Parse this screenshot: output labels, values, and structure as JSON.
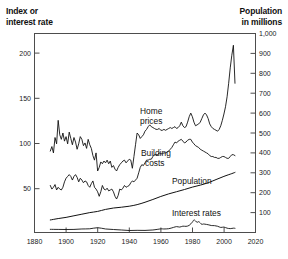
{
  "left_axis_title": "Index or\ninterest rate",
  "right_axis_title": "Population\nin millions",
  "labels": {
    "home_prices": "Home",
    "home_prices2": "prices",
    "building_costs": "Building",
    "building_costs2": "costs",
    "population": "Population",
    "interest_rates": "Interest rates"
  },
  "ticks": {
    "x": [
      "1880",
      "1900",
      "1920",
      "1940",
      "1960",
      "1980",
      "2000",
      "2020"
    ],
    "y_left": [
      "200",
      "150",
      "100",
      "50"
    ],
    "y_right": [
      "1,000",
      "900",
      "800",
      "700",
      "600",
      "500",
      "400",
      "300",
      "200",
      "100"
    ]
  },
  "colors": {
    "background": "#ffffff",
    "line": "#111111",
    "frame": "#4d4d4d",
    "text": "#111111"
  },
  "chart_data": {
    "type": "line",
    "title": "",
    "xlabel": "",
    "ylabel": "Index or interest rate",
    "ylabel_right": "Population in millions",
    "xlim": [
      1880,
      2020
    ],
    "ylim": [
      0,
      220
    ],
    "ylim_right": [
      0,
      1000
    ],
    "grid": false,
    "legend": "inline-annotations",
    "xticks": [
      1880,
      1900,
      1920,
      1940,
      1960,
      1980,
      2000,
      2020
    ],
    "yticks_left": [
      50,
      100,
      150,
      200
    ],
    "yticks_right": [
      100,
      200,
      300,
      400,
      500,
      600,
      700,
      800,
      900,
      1000
    ],
    "series": [
      {
        "name": "Home prices",
        "axis": "left",
        "x": [
          1890,
          1891,
          1892,
          1893,
          1894,
          1895,
          1896,
          1897,
          1898,
          1899,
          1900,
          1901,
          1902,
          1903,
          1904,
          1905,
          1906,
          1907,
          1908,
          1909,
          1910,
          1911,
          1912,
          1913,
          1914,
          1915,
          1916,
          1917,
          1918,
          1919,
          1920,
          1921,
          1922,
          1923,
          1924,
          1925,
          1926,
          1927,
          1928,
          1929,
          1930,
          1931,
          1932,
          1933,
          1934,
          1935,
          1936,
          1937,
          1938,
          1939,
          1940,
          1941,
          1942,
          1943,
          1944,
          1945,
          1946,
          1947,
          1948,
          1949,
          1950,
          1951,
          1952,
          1953,
          1954,
          1955,
          1956,
          1957,
          1958,
          1959,
          1960,
          1961,
          1962,
          1963,
          1964,
          1965,
          1966,
          1967,
          1968,
          1969,
          1970,
          1971,
          1972,
          1973,
          1974,
          1975,
          1976,
          1977,
          1978,
          1979,
          1980,
          1981,
          1982,
          1983,
          1984,
          1985,
          1986,
          1987,
          1988,
          1989,
          1990,
          1991,
          1992,
          1993,
          1994,
          1995,
          1996,
          1997,
          1998,
          1999,
          2000,
          2001,
          2002,
          2003,
          2004,
          2005,
          2006,
          2007
        ],
        "values": [
          90,
          95,
          88,
          105,
          98,
          124,
          108,
          103,
          110,
          101,
          106,
          98,
          111,
          104,
          97,
          105,
          100,
          92,
          98,
          106,
          103,
          96,
          99,
          93,
          103,
          97,
          93,
          85,
          80,
          88,
          68,
          72,
          78,
          76,
          79,
          77,
          80,
          76,
          79,
          72,
          74,
          70,
          68,
          72,
          75,
          77,
          79,
          80,
          77,
          79,
          81,
          80,
          71,
          84,
          97,
          110,
          108,
          104,
          106,
          108,
          112,
          114,
          117,
          119,
          117,
          116,
          115,
          114,
          114,
          115,
          113,
          113,
          114,
          113,
          114,
          115,
          116,
          115,
          116,
          117,
          115,
          116,
          118,
          122,
          118,
          116,
          117,
          122,
          128,
          132,
          128,
          122,
          118,
          119,
          120,
          122,
          126,
          130,
          132,
          130,
          126,
          120,
          117,
          115,
          114,
          113,
          112,
          114,
          118,
          124,
          131,
          139,
          150,
          165,
          182,
          196,
          207,
          165
        ]
      },
      {
        "name": "Building costs",
        "axis": "left",
        "x": [
          1890,
          1891,
          1892,
          1893,
          1894,
          1895,
          1896,
          1897,
          1898,
          1899,
          1900,
          1901,
          1902,
          1903,
          1904,
          1905,
          1906,
          1907,
          1908,
          1909,
          1910,
          1911,
          1912,
          1913,
          1914,
          1915,
          1916,
          1917,
          1918,
          1919,
          1920,
          1921,
          1922,
          1923,
          1924,
          1925,
          1926,
          1927,
          1928,
          1929,
          1930,
          1931,
          1932,
          1933,
          1934,
          1935,
          1936,
          1937,
          1938,
          1939,
          1940,
          1941,
          1942,
          1943,
          1944,
          1945,
          1946,
          1947,
          1948,
          1949,
          1950,
          1951,
          1952,
          1953,
          1954,
          1955,
          1956,
          1957,
          1958,
          1959,
          1960,
          1961,
          1962,
          1963,
          1964,
          1965,
          1966,
          1967,
          1968,
          1969,
          1970,
          1971,
          1972,
          1973,
          1974,
          1975,
          1976,
          1977,
          1978,
          1979,
          1980,
          1981,
          1982,
          1983,
          1984,
          1985,
          1986,
          1987,
          1988,
          1989,
          1990,
          1991,
          1992,
          1993,
          1994,
          1995,
          1996,
          1997,
          1998,
          1999,
          2000,
          2001,
          2002,
          2003,
          2004,
          2005,
          2006,
          2007
        ],
        "values": [
          52,
          48,
          50,
          53,
          47,
          50,
          48,
          47,
          50,
          56,
          60,
          62,
          64,
          62,
          58,
          62,
          64,
          61,
          56,
          60,
          58,
          55,
          57,
          56,
          52,
          50,
          54,
          57,
          50,
          48,
          45,
          40,
          45,
          52,
          48,
          47,
          49,
          46,
          47,
          48,
          45,
          40,
          37,
          41,
          48,
          47,
          49,
          52,
          50,
          51,
          52,
          55,
          57,
          56,
          58,
          60,
          66,
          72,
          75,
          74,
          77,
          80,
          80,
          81,
          81,
          84,
          86,
          86,
          86,
          88,
          87,
          87,
          88,
          88,
          89,
          90,
          92,
          94,
          97,
          100,
          99,
          101,
          102,
          103,
          101,
          99,
          100,
          102,
          103,
          103,
          100,
          98,
          96,
          95,
          94,
          92,
          91,
          90,
          89,
          88,
          87,
          85,
          84,
          84,
          83,
          83,
          82,
          82,
          83,
          84,
          84,
          83,
          82,
          82,
          84,
          86,
          86,
          85
        ]
      },
      {
        "name": "Population",
        "axis": "right",
        "x": [
          1890,
          1895,
          1900,
          1905,
          1910,
          1915,
          1920,
          1925,
          1930,
          1935,
          1940,
          1945,
          1950,
          1955,
          1960,
          1965,
          1970,
          1975,
          1980,
          1985,
          1990,
          1995,
          2000,
          2005,
          2007
        ],
        "values": [
          63,
          70,
          76,
          84,
          92,
          100,
          106,
          116,
          123,
          127,
          132,
          140,
          152,
          166,
          181,
          194,
          205,
          216,
          228,
          238,
          250,
          266,
          282,
          296,
          302
        ]
      },
      {
        "name": "Interest rates",
        "axis": "left",
        "x": [
          1890,
          1895,
          1900,
          1905,
          1910,
          1915,
          1920,
          1925,
          1930,
          1935,
          1940,
          1945,
          1950,
          1955,
          1960,
          1962,
          1965,
          1968,
          1970,
          1972,
          1974,
          1976,
          1978,
          1980,
          1981,
          1982,
          1983,
          1984,
          1985,
          1986,
          1987,
          1988,
          1990,
          1992,
          1994,
          1996,
          1998,
          2000,
          2002,
          2004,
          2006,
          2007
        ],
        "values": [
          3.5,
          3.4,
          3.3,
          3.4,
          3.9,
          4.1,
          5.3,
          3.9,
          3.3,
          2.8,
          2.2,
          2.4,
          2.3,
          2.8,
          4.0,
          3.9,
          4.2,
          5.6,
          6.5,
          6.0,
          7.0,
          6.8,
          7.9,
          11.5,
          13.9,
          12.8,
          11.2,
          12.0,
          10.6,
          9.0,
          9.4,
          9.2,
          8.6,
          7.7,
          7.6,
          6.9,
          5.6,
          6.0,
          4.8,
          4.3,
          4.8,
          4.6
        ]
      }
    ]
  }
}
